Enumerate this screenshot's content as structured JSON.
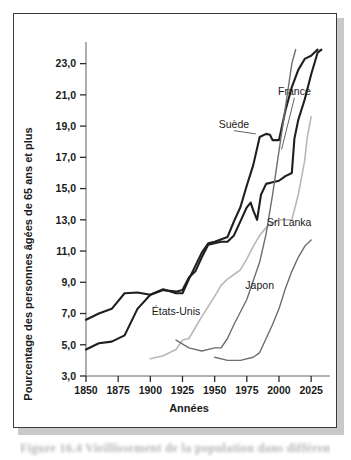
{
  "figure": {
    "caption_fragment": "Figure 16.4 Vieillissement de la population dans différents"
  },
  "chart_data": {
    "type": "line",
    "title": "",
    "xlabel": "Années",
    "ylabel": "Pourcentage des personnes âgées de 65 ans et plus",
    "xlim": [
      1850,
      2035
    ],
    "ylim": [
      3.0,
      24.0
    ],
    "grid": false,
    "legend_position": "inline-annotations",
    "x_ticks": [
      "1850",
      "1875",
      "1900",
      "1925",
      "1950",
      "1975",
      "2000",
      "2025"
    ],
    "x_tick_values": [
      1850,
      1875,
      1900,
      1925,
      1950,
      1975,
      2000,
      2025
    ],
    "y_ticks": [
      "3,0",
      "5,0",
      "7,0",
      "9,0",
      "11,0",
      "13,0",
      "15,0",
      "17,0",
      "19,0",
      "21,0",
      "23,0"
    ],
    "y_tick_values": [
      3.0,
      5.0,
      7.0,
      9.0,
      11.0,
      13.0,
      15.0,
      17.0,
      19.0,
      21.0,
      23.0
    ],
    "decimal_separator": ",",
    "series": [
      {
        "name": "Suède",
        "color": "#1f1f1f",
        "width": 2.1,
        "label_anchor": {
          "x": 1965,
          "y": 18.9
        },
        "leader_to": {
          "x": 1982,
          "y": 18.5
        },
        "points": [
          [
            1850,
            6.6
          ],
          [
            1860,
            7.0
          ],
          [
            1870,
            7.3
          ],
          [
            1880,
            8.3
          ],
          [
            1890,
            8.35
          ],
          [
            1900,
            8.2
          ],
          [
            1910,
            8.55
          ],
          [
            1920,
            8.3
          ],
          [
            1925,
            8.3
          ],
          [
            1930,
            9.2
          ],
          [
            1940,
            10.9
          ],
          [
            1945,
            11.5
          ],
          [
            1950,
            11.6
          ],
          [
            1960,
            11.9
          ],
          [
            1965,
            12.9
          ],
          [
            1970,
            13.8
          ],
          [
            1975,
            15.2
          ],
          [
            1980,
            16.5
          ],
          [
            1985,
            18.3
          ],
          [
            1990,
            18.5
          ],
          [
            1993,
            18.45
          ],
          [
            1995,
            18.1
          ],
          [
            2000,
            18.1
          ],
          [
            2005,
            20.0
          ],
          [
            2010,
            21.5
          ],
          [
            2015,
            22.6
          ],
          [
            2020,
            23.3
          ],
          [
            2025,
            23.5
          ],
          [
            2030,
            23.9
          ]
        ]
      },
      {
        "name": "France",
        "color": "#1f1f1f",
        "width": 2.1,
        "label_anchor": {
          "x": 2012,
          "y": 21.0
        },
        "leader_to": {
          "x": 2002,
          "y": 17.5
        },
        "points": [
          [
            1850,
            4.7
          ],
          [
            1860,
            5.1
          ],
          [
            1870,
            5.2
          ],
          [
            1880,
            5.6
          ],
          [
            1890,
            7.3
          ],
          [
            1900,
            8.2
          ],
          [
            1910,
            8.5
          ],
          [
            1920,
            8.4
          ],
          [
            1925,
            8.5
          ],
          [
            1930,
            9.3
          ],
          [
            1935,
            9.7
          ],
          [
            1940,
            10.6
          ],
          [
            1945,
            11.4
          ],
          [
            1950,
            11.5
          ],
          [
            1955,
            11.6
          ],
          [
            1960,
            11.6
          ],
          [
            1965,
            12.0
          ],
          [
            1970,
            12.9
          ],
          [
            1975,
            13.8
          ],
          [
            1978,
            14.1
          ],
          [
            1980,
            13.6
          ],
          [
            1983,
            13.0
          ],
          [
            1986,
            14.6
          ],
          [
            1990,
            15.3
          ],
          [
            1995,
            15.4
          ],
          [
            2000,
            15.5
          ],
          [
            2005,
            15.8
          ],
          [
            2010,
            16.0
          ],
          [
            2012,
            18.2
          ],
          [
            2015,
            19.4
          ],
          [
            2020,
            20.7
          ],
          [
            2025,
            22.3
          ],
          [
            2030,
            23.7
          ],
          [
            2033,
            23.9
          ]
        ]
      },
      {
        "name": "États-Unis",
        "color": "#b8b8b8",
        "width": 1.6,
        "label_anchor": {
          "x": 1920,
          "y": 6.9
        },
        "leader_to": null,
        "points": [
          [
            1900,
            4.1
          ],
          [
            1910,
            4.3
          ],
          [
            1920,
            4.7
          ],
          [
            1925,
            5.3
          ],
          [
            1930,
            5.4
          ],
          [
            1940,
            6.8
          ],
          [
            1950,
            8.1
          ],
          [
            1955,
            8.8
          ],
          [
            1960,
            9.2
          ],
          [
            1965,
            9.5
          ],
          [
            1970,
            9.8
          ],
          [
            1975,
            10.5
          ],
          [
            1980,
            11.3
          ],
          [
            1985,
            12.0
          ],
          [
            1990,
            12.5
          ],
          [
            1995,
            12.8
          ],
          [
            2000,
            13.0
          ],
          [
            2005,
            13.0
          ],
          [
            2010,
            13.0
          ],
          [
            2015,
            14.6
          ],
          [
            2020,
            16.8
          ],
          [
            2022,
            18.3
          ],
          [
            2025,
            19.6
          ]
        ]
      },
      {
        "name": "Japon",
        "color": "#6e6e6e",
        "width": 1.4,
        "label_anchor": {
          "x": 1985,
          "y": 8.6
        },
        "leader_to": null,
        "points": [
          [
            1920,
            5.3
          ],
          [
            1930,
            4.8
          ],
          [
            1940,
            4.6
          ],
          [
            1950,
            4.8
          ],
          [
            1955,
            4.8
          ],
          [
            1960,
            5.4
          ],
          [
            1965,
            6.3
          ],
          [
            1970,
            7.1
          ],
          [
            1975,
            7.9
          ],
          [
            1980,
            9.1
          ],
          [
            1985,
            10.3
          ],
          [
            1990,
            12.1
          ],
          [
            1995,
            14.6
          ],
          [
            2000,
            17.4
          ],
          [
            2005,
            20.2
          ],
          [
            2010,
            23.0
          ],
          [
            2013,
            23.9
          ]
        ]
      },
      {
        "name": "Sri Lanka",
        "color": "#6e6e6e",
        "width": 1.4,
        "label_anchor": {
          "x": 2008,
          "y": 12.6
        },
        "leader_to": null,
        "points": [
          [
            1950,
            4.2
          ],
          [
            1960,
            4.0
          ],
          [
            1970,
            4.0
          ],
          [
            1980,
            4.2
          ],
          [
            1985,
            4.5
          ],
          [
            1990,
            5.4
          ],
          [
            1995,
            6.3
          ],
          [
            2000,
            7.3
          ],
          [
            2005,
            8.6
          ],
          [
            2010,
            9.7
          ],
          [
            2015,
            10.6
          ],
          [
            2020,
            11.3
          ],
          [
            2025,
            11.7
          ]
        ]
      }
    ]
  }
}
